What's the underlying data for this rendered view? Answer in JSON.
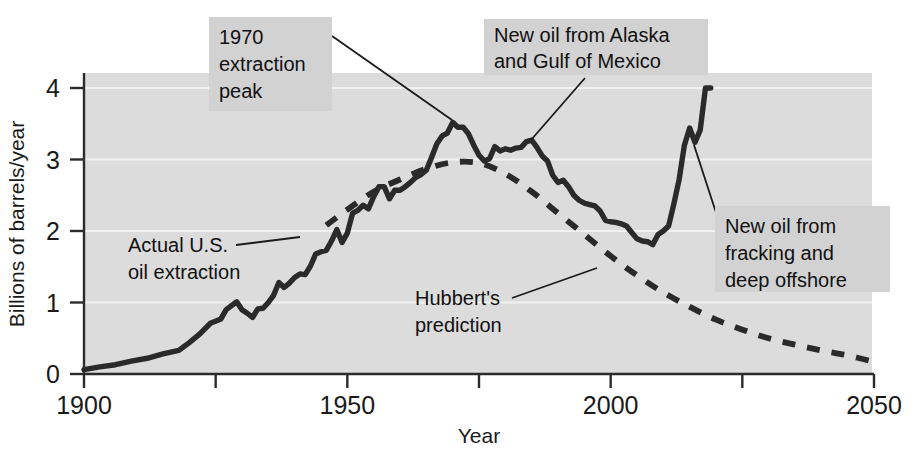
{
  "figure": {
    "background_color": "#ffffff",
    "plot_background_color": "#dcdcdc",
    "series_color": "#2a2a2a",
    "annotation_box_color": "#d2d2d2"
  },
  "axes": {
    "x_title": "Year",
    "y_title": "Billions of barrels/year",
    "x_ticks": [
      "1900",
      "1950",
      "2000",
      "2050"
    ],
    "x_tick_values": [
      1900,
      1950,
      2000,
      2050
    ],
    "x_minor_tick_values": [
      1925,
      1975,
      2025
    ],
    "y_ticks": [
      "0",
      "1",
      "2",
      "3",
      "4"
    ],
    "y_tick_values": [
      0,
      1,
      2,
      3,
      4
    ]
  },
  "annotations": [
    {
      "id": "peak-1970",
      "lines": [
        "1970",
        "extraction",
        "peak"
      ],
      "box": {
        "x": 209,
        "y": 17,
        "w": 123,
        "h": 94
      },
      "text_x": 219,
      "text_y0": 44,
      "line_height": 27,
      "leader": [
        [
          332,
          36
        ],
        [
          452,
          120
        ]
      ]
    },
    {
      "id": "alaska-gulf",
      "lines": [
        "New oil from Alaska",
        "and Gulf of Mexico"
      ],
      "box": {
        "x": 484,
        "y": 19,
        "w": 224,
        "h": 56
      },
      "text_x": 494,
      "text_y0": 42,
      "line_height": 26,
      "leader": [
        [
          585,
          78
        ],
        [
          531,
          140
        ]
      ]
    },
    {
      "id": "actual-us-oil",
      "lines": [
        "Actual U.S.",
        "oil extraction"
      ],
      "box": null,
      "text_x": 128,
      "text_y0": 252,
      "line_height": 27,
      "leader": [
        [
          236,
          245
        ],
        [
          300,
          237
        ]
      ]
    },
    {
      "id": "hubbert-prediction",
      "lines": [
        "Hubbert's",
        "prediction"
      ],
      "box": null,
      "text_x": 415,
      "text_y0": 305,
      "line_height": 27,
      "leader": [
        [
          512,
          298
        ],
        [
          597,
          268
        ]
      ]
    },
    {
      "id": "fracking-offshore",
      "lines": [
        "New oil from",
        "fracking and",
        "deep offshore"
      ],
      "box": {
        "x": 715,
        "y": 206,
        "w": 175,
        "h": 86
      },
      "text_x": 725,
      "text_y0": 233,
      "line_height": 27,
      "leader": [
        [
          722,
          231
        ],
        [
          694,
          145
        ]
      ]
    }
  ],
  "chart_data": {
    "type": "line",
    "title": "",
    "xlabel": "Year",
    "ylabel": "Billions of barrels/year",
    "xlim": [
      1900,
      2050
    ],
    "ylim": [
      0,
      4.3
    ],
    "grid": true,
    "legend": "none",
    "series": [
      {
        "name": "Actual U.S. oil extraction",
        "style": "solid",
        "x": [
          1900,
          1903,
          1906,
          1909,
          1912,
          1915,
          1918,
          1920,
          1922,
          1924,
          1926,
          1927,
          1929,
          1930,
          1931,
          1932,
          1933,
          1934,
          1935,
          1936,
          1937,
          1938,
          1939,
          1940,
          1941,
          1942,
          1943,
          1944,
          1945,
          1946,
          1947,
          1948,
          1949,
          1950,
          1951,
          1952,
          1953,
          1954,
          1955,
          1956,
          1957,
          1958,
          1959,
          1960,
          1961,
          1962,
          1963,
          1964,
          1965,
          1966,
          1967,
          1968,
          1969,
          1970,
          1971,
          1972,
          1973,
          1974,
          1975,
          1976,
          1977,
          1978,
          1979,
          1980,
          1981,
          1982,
          1983,
          1984,
          1985,
          1986,
          1987,
          1988,
          1989,
          1990,
          1991,
          1992,
          1993,
          1994,
          1995,
          1996,
          1997,
          1998,
          1999,
          2000,
          2001,
          2002,
          2003,
          2004,
          2005,
          2006,
          2007,
          2008,
          2009,
          2010,
          2011,
          2012,
          2013,
          2014,
          2015,
          2016,
          2017,
          2018,
          2019
        ],
        "y": [
          0.06,
          0.1,
          0.13,
          0.18,
          0.22,
          0.28,
          0.33,
          0.44,
          0.56,
          0.71,
          0.77,
          0.9,
          1.01,
          0.9,
          0.85,
          0.79,
          0.91,
          0.92,
          1.0,
          1.1,
          1.28,
          1.21,
          1.27,
          1.35,
          1.4,
          1.39,
          1.51,
          1.68,
          1.71,
          1.73,
          1.86,
          2.02,
          1.84,
          1.97,
          2.25,
          2.29,
          2.36,
          2.31,
          2.48,
          2.62,
          2.62,
          2.45,
          2.57,
          2.57,
          2.62,
          2.68,
          2.75,
          2.79,
          2.85,
          3.03,
          3.22,
          3.33,
          3.37,
          3.52,
          3.45,
          3.45,
          3.36,
          3.2,
          3.06,
          2.98,
          3.01,
          3.18,
          3.12,
          3.15,
          3.13,
          3.16,
          3.17,
          3.25,
          3.27,
          3.17,
          3.05,
          2.98,
          2.78,
          2.68,
          2.71,
          2.62,
          2.5,
          2.43,
          2.39,
          2.37,
          2.35,
          2.28,
          2.15,
          2.13,
          2.12,
          2.1,
          2.07,
          1.98,
          1.89,
          1.86,
          1.85,
          1.81,
          1.95,
          2.0,
          2.07,
          2.38,
          2.72,
          3.2,
          3.44,
          3.24,
          3.41,
          4.0,
          4.0
        ],
        "annotations_ref": [
          "actual-us-oil",
          "peak-1970",
          "alaska-gulf",
          "fracking-offshore"
        ]
      },
      {
        "name": "Hubbert's prediction",
        "style": "dashed",
        "x": [
          1946,
          1950,
          1955,
          1960,
          1965,
          1970,
          1975,
          1980,
          1985,
          1990,
          1995,
          2000,
          2005,
          2010,
          2015,
          2020,
          2025,
          2030,
          2035,
          2040,
          2045,
          2050
        ],
        "y": [
          2.08,
          2.3,
          2.55,
          2.72,
          2.87,
          2.96,
          2.95,
          2.8,
          2.55,
          2.25,
          1.95,
          1.65,
          1.38,
          1.14,
          0.94,
          0.76,
          0.62,
          0.5,
          0.41,
          0.33,
          0.26,
          0.17
        ],
        "annotations_ref": [
          "hubbert-prediction"
        ]
      }
    ]
  }
}
